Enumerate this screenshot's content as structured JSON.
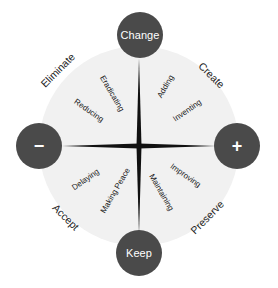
{
  "colors": {
    "node_fill": "#4a4a4a",
    "disc_fill": "#f1f1f1",
    "axis": "#111111",
    "text": "#1c1c1c"
  },
  "axes": {
    "top": {
      "label": "Change"
    },
    "bottom": {
      "label": "Keep"
    },
    "left": {
      "label": "−",
      "icon": "minus-icon"
    },
    "right": {
      "label": "+",
      "icon": "plus-icon"
    }
  },
  "quadrants": {
    "top_left": {
      "title": "Eliminate",
      "items": [
        "Eradicating",
        "Reducing"
      ]
    },
    "top_right": {
      "title": "Create",
      "items": [
        "Adding",
        "Inventing"
      ]
    },
    "bottom_left": {
      "title": "Accept",
      "items": [
        "Delaying",
        "Making Peace"
      ]
    },
    "bottom_right": {
      "title": "Preserve",
      "items": [
        "Improving",
        "Maintaining"
      ]
    }
  }
}
